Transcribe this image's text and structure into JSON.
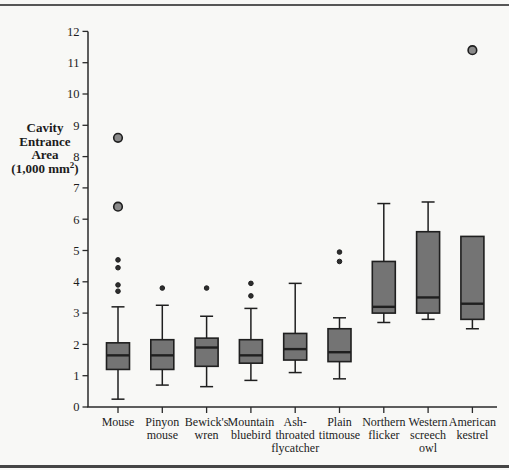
{
  "figure": {
    "background": "#f8f8f6",
    "top_rule_color": "#565656",
    "bottom_rule_color": "#454545"
  },
  "y_axis_title": {
    "lines": [
      "Cavity",
      "Entrance",
      "Area"
    ],
    "unit_pre": "(1,000 mm",
    "unit_sup": "2",
    "unit_post": ")"
  },
  "chart_data": {
    "type": "boxplot",
    "title": "",
    "xlabel": "",
    "ylabel": "Cavity Entrance Area (1,000 mm2)",
    "ylim": [
      0,
      12
    ],
    "yticks": [
      "0",
      "1",
      "2",
      "3",
      "4",
      "5",
      "6",
      "7",
      "8",
      "9",
      "10",
      "11",
      "12"
    ],
    "grid": false,
    "legend": false,
    "colors": {
      "box_fill": "#747474",
      "line": "#1f1f1f",
      "large_outlier_fill": "#8a8a8a",
      "small_outlier_fill": "#2e2e2e",
      "axis": "#2a2a2a"
    },
    "boxes": [
      {
        "label": "Mouse",
        "label_lines": [
          "Mouse"
        ],
        "whisker_low": 0.25,
        "q1": 1.2,
        "median": 1.65,
        "q3": 2.05,
        "whisker_high": 3.2,
        "outliers_small": [
          3.7,
          3.9,
          4.45,
          4.7
        ],
        "outliers_large": [
          6.4,
          8.6
        ]
      },
      {
        "label": "Pinyon mouse",
        "label_lines": [
          "Pinyon",
          "mouse"
        ],
        "whisker_low": 0.7,
        "q1": 1.2,
        "median": 1.65,
        "q3": 2.15,
        "whisker_high": 3.25,
        "outliers_small": [
          3.8
        ],
        "outliers_large": []
      },
      {
        "label": "Bewick's wren",
        "label_lines": [
          "Bewick's",
          "wren"
        ],
        "whisker_low": 0.65,
        "q1": 1.3,
        "median": 1.9,
        "q3": 2.2,
        "whisker_high": 2.9,
        "outliers_small": [
          3.8
        ],
        "outliers_large": []
      },
      {
        "label": "Mountain bluebird",
        "label_lines": [
          "Mountain",
          "bluebird"
        ],
        "whisker_low": 0.85,
        "q1": 1.4,
        "median": 1.65,
        "q3": 2.15,
        "whisker_high": 3.15,
        "outliers_small": [
          3.55,
          3.95
        ],
        "outliers_large": []
      },
      {
        "label": "Ash-throated flycatcher",
        "label_lines": [
          "Ash-",
          "throated",
          "flycatcher"
        ],
        "whisker_low": 1.1,
        "q1": 1.5,
        "median": 1.85,
        "q3": 2.35,
        "whisker_high": 3.95,
        "outliers_small": [],
        "outliers_large": []
      },
      {
        "label": "Plain titmouse",
        "label_lines": [
          "Plain",
          "titmouse"
        ],
        "whisker_low": 0.9,
        "q1": 1.45,
        "median": 1.75,
        "q3": 2.5,
        "whisker_high": 2.85,
        "outliers_small": [
          4.65,
          4.95
        ],
        "outliers_large": []
      },
      {
        "label": "Northern flicker",
        "label_lines": [
          "Northern",
          "flicker"
        ],
        "whisker_low": 2.7,
        "q1": 3.0,
        "median": 3.2,
        "q3": 4.65,
        "whisker_high": 6.5,
        "outliers_small": [],
        "outliers_large": []
      },
      {
        "label": "Western screech owl",
        "label_lines": [
          "Western",
          "screech",
          "owl"
        ],
        "whisker_low": 2.8,
        "q1": 3.0,
        "median": 3.5,
        "q3": 5.6,
        "whisker_high": 6.55,
        "outliers_small": [],
        "outliers_large": []
      },
      {
        "label": "American kestrel",
        "label_lines": [
          "American",
          "kestrel"
        ],
        "whisker_low": 2.5,
        "q1": 2.8,
        "median": 3.3,
        "q3": 5.45,
        "whisker_high": 5.45,
        "outliers_small": [],
        "outliers_large": [
          11.4
        ]
      }
    ]
  }
}
